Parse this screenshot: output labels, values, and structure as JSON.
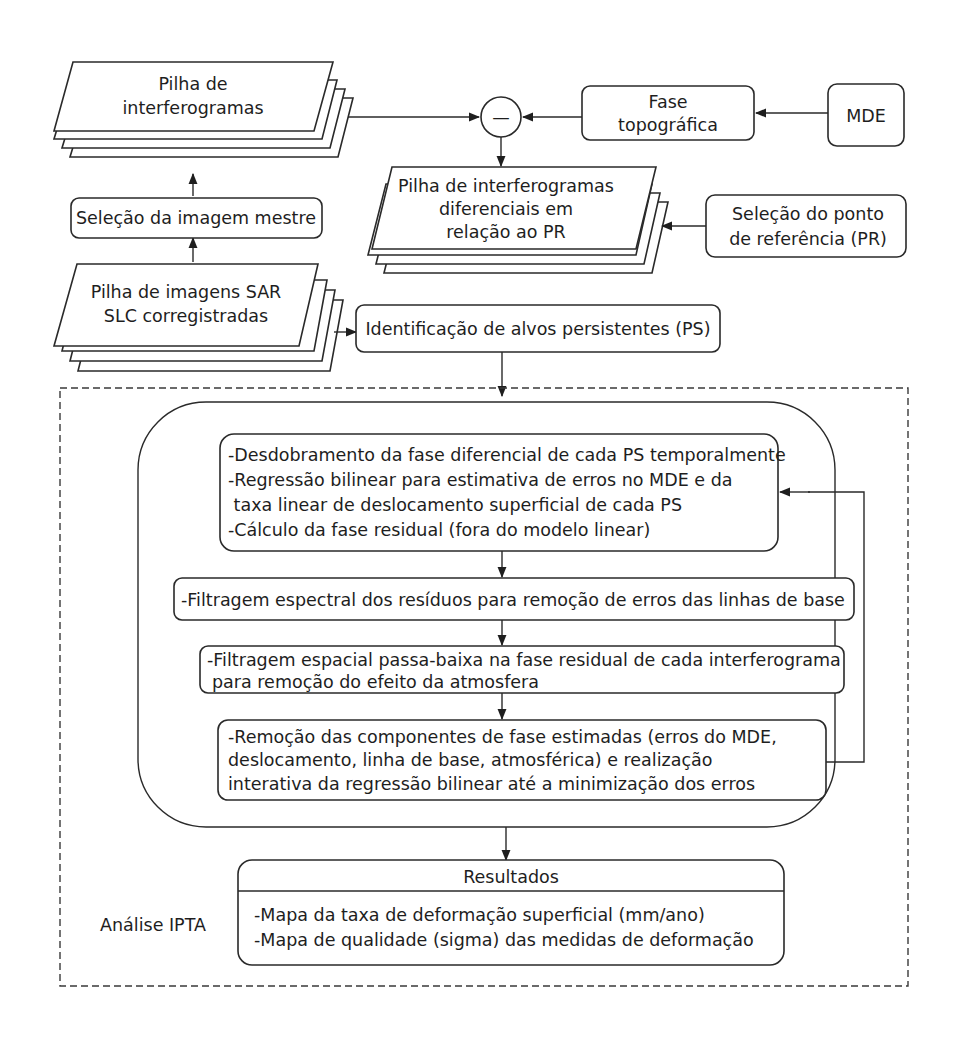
{
  "diagram": {
    "nodes": {
      "interferogram_stack": {
        "lines": [
          "Pilha de",
          "interferogramas"
        ]
      },
      "master_selection": {
        "lines": [
          "Seleção da imagem mestre"
        ]
      },
      "sar_stack": {
        "lines": [
          "Pilha de imagens SAR",
          "SLC  corregistradas"
        ]
      },
      "subtract_operator": {
        "symbol": "—"
      },
      "topographic_phase": {
        "lines": [
          "Fase",
          "topográfica"
        ]
      },
      "dem": {
        "lines": [
          "MDE"
        ]
      },
      "differential_stack": {
        "lines": [
          "Pilha de interferogramas",
          "diferenciais em",
          "relação ao PR"
        ]
      },
      "reference_point": {
        "lines": [
          "Seleção do ponto",
          "de referência (PR)"
        ]
      },
      "ps_identification": {
        "lines": [
          "Identificação de alvos persistentes (PS)"
        ]
      },
      "step_unwrapping": {
        "lines": [
          "-Desdobramento da fase diferencial de cada PS temporalmente",
          "-Regressão bilinear para estimativa de erros no MDE e da",
          " taxa linear de deslocamento superficial de cada PS",
          "-Cálculo da fase residual (fora do modelo linear)"
        ]
      },
      "step_spectral_filter": {
        "lines": [
          "-Filtragem espectral dos resíduos para remoção de erros das linhas de base"
        ]
      },
      "step_spatial_filter": {
        "lines": [
          "-Filtragem espacial passa-baixa na fase residual de cada interferograma",
          "para remoção do efeito da atmosfera"
        ]
      },
      "step_removal": {
        "lines": [
          "-Remoção das componentes de fase estimadas (erros do MDE,",
          "deslocamento, linha de base, atmosférica) e realização",
          "interativa da regressão bilinear até a minimização dos erros"
        ]
      },
      "results": {
        "title": "Resultados",
        "lines": [
          "-Mapa da taxa de deformação superficial (mm/ano)",
          "-Mapa de qualidade (sigma) das medidas de deformação"
        ]
      }
    },
    "group_label": "Análise IPTA"
  }
}
